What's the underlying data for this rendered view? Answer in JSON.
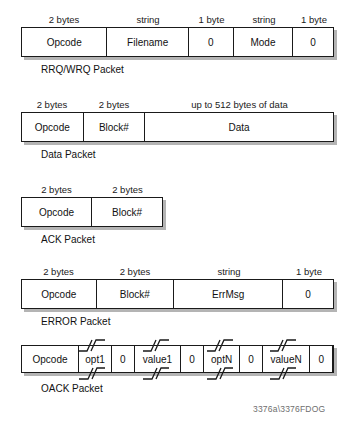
{
  "figure": {
    "watermark": "3376a\\3376FDOG",
    "line_color": "#1a1a1a",
    "shadow_color": "#b4b4b4",
    "background": "#ffffff"
  },
  "packets": [
    {
      "id": "rrq-wrq",
      "caption": "RRQ/WRQ Packet",
      "headers": [
        "2 bytes",
        "string",
        "1 byte",
        "string",
        "1 byte"
      ],
      "fields": [
        "Opcode",
        "Filename",
        "0",
        "Mode",
        "0"
      ]
    },
    {
      "id": "data",
      "caption": "Data Packet",
      "headers": [
        "2 bytes",
        "2 bytes",
        "up to 512 bytes of data"
      ],
      "fields": [
        "Opcode",
        "Block#",
        "Data"
      ]
    },
    {
      "id": "ack",
      "caption": "ACK Packet",
      "headers": [
        "2 bytes",
        "2 bytes"
      ],
      "fields": [
        "Opcode",
        "Block#"
      ]
    },
    {
      "id": "error",
      "caption": "ERROR Packet",
      "headers": [
        "2 bytes",
        "2 bytes",
        "string",
        "1 byte"
      ],
      "fields": [
        "Opcode",
        "Block#",
        "ErrMsg",
        "0"
      ]
    },
    {
      "id": "oack",
      "caption": "OACK Packet",
      "headers": [],
      "fields": [
        "Opcode",
        "opt1",
        "0",
        "value1",
        "0",
        "optN",
        "0",
        "valueN",
        "0"
      ]
    }
  ]
}
